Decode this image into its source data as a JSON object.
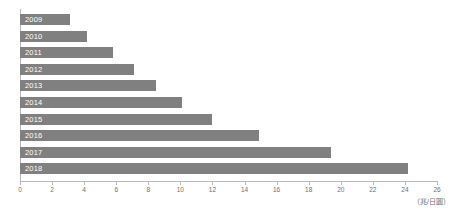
{
  "chart_data": {
    "type": "bar",
    "orientation": "horizontal",
    "title": "",
    "subtitle": "",
    "xlabel": "",
    "ylabel": "",
    "unit_label": "（兆/日圓）",
    "categories": [
      "2009",
      "2010",
      "2011",
      "2012",
      "2013",
      "2014",
      "2015",
      "2016",
      "2017",
      "2018"
    ],
    "values": [
      3.1,
      4.2,
      5.8,
      7.1,
      8.5,
      10.1,
      12.0,
      14.9,
      19.4,
      24.2
    ],
    "series": [
      {
        "name": "",
        "values": [
          3.1,
          4.2,
          5.8,
          7.1,
          8.5,
          10.1,
          12.0,
          14.9,
          19.4,
          24.2
        ]
      }
    ],
    "xlim": [
      0,
      26
    ],
    "xticks": [
      0,
      2,
      4,
      6,
      8,
      10,
      12,
      14,
      16,
      18,
      20,
      22,
      24,
      26
    ],
    "xtick_labels": [
      "0",
      "2",
      "4",
      "6",
      "8",
      "10",
      "12",
      "14",
      "16",
      "18",
      "20",
      "22",
      "24",
      "26"
    ],
    "grid": false,
    "legend": false,
    "legend_position": "none",
    "bar_color": "#808080",
    "bar_label_color": "#ffffff",
    "axis_color": "#b9b9b9",
    "tick_label_color": "#6d6d6d"
  }
}
